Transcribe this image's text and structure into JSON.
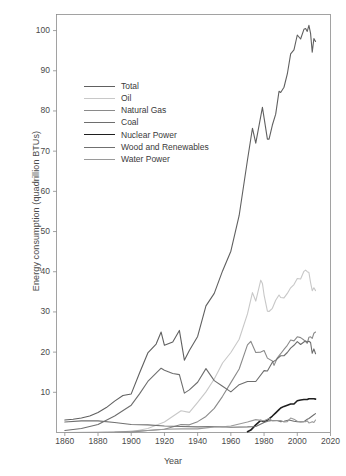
{
  "chart_data": {
    "type": "line",
    "title": "",
    "xlabel": "Year",
    "ylabel": "Energy consumption (quadrillion BTUs)",
    "xlim": [
      1855,
      2020
    ],
    "ylim": [
      0,
      104
    ],
    "xticks": [
      1860,
      1880,
      1900,
      1920,
      1940,
      1960,
      1980,
      2000,
      2020
    ],
    "yticks": [
      10,
      20,
      30,
      40,
      50,
      60,
      70,
      80,
      90,
      100
    ],
    "grid": false,
    "legend_position": "upper left",
    "series": [
      {
        "name": "Total",
        "color": "#606060",
        "width": 1.1,
        "x": [
          1860,
          1865,
          1870,
          1875,
          1880,
          1885,
          1890,
          1895,
          1900,
          1905,
          1910,
          1915,
          1918,
          1920,
          1925,
          1929,
          1932,
          1935,
          1940,
          1945,
          1950,
          1955,
          1960,
          1965,
          1970,
          1973,
          1975,
          1979,
          1980,
          1982,
          1983,
          1985,
          1987,
          1989,
          1990,
          1992,
          1994,
          1996,
          1998,
          2000,
          2002,
          2004,
          2005,
          2006,
          2007,
          2008,
          2009,
          2010,
          2011
        ],
        "values": [
          3.1,
          3.3,
          3.6,
          4.1,
          5.0,
          6.2,
          7.8,
          9.2,
          9.6,
          14.8,
          19.8,
          22.0,
          25.0,
          21.7,
          22.5,
          25.4,
          18.0,
          20.4,
          23.9,
          31.5,
          34.6,
          40.2,
          45.1,
          54.0,
          67.8,
          75.7,
          72.0,
          80.9,
          78.3,
          73.0,
          73.0,
          76.5,
          79.2,
          84.9,
          84.6,
          85.9,
          89.2,
          94.2,
          95.2,
          98.9,
          97.9,
          100.3,
          100.5,
          99.8,
          101.3,
          99.3,
          94.6,
          98.0,
          97.3
        ]
      },
      {
        "name": "Oil",
        "color": "#c8c8c8",
        "width": 1.1,
        "x": [
          1860,
          1880,
          1900,
          1910,
          1920,
          1930,
          1935,
          1940,
          1945,
          1950,
          1955,
          1960,
          1965,
          1970,
          1973,
          1975,
          1978,
          1979,
          1980,
          1982,
          1983,
          1985,
          1987,
          1989,
          1990,
          1992,
          1994,
          1996,
          1998,
          2000,
          2002,
          2004,
          2005,
          2006,
          2007,
          2008,
          2009,
          2010,
          2011
        ],
        "values": [
          0.0,
          0.1,
          0.2,
          1.0,
          2.6,
          5.4,
          5.0,
          7.5,
          10.1,
          13.3,
          17.3,
          19.9,
          23.2,
          29.5,
          34.8,
          32.7,
          37.9,
          37.1,
          34.2,
          30.2,
          30.1,
          30.9,
          32.9,
          34.2,
          33.6,
          33.5,
          34.6,
          36.0,
          36.8,
          38.3,
          38.2,
          40.1,
          40.4,
          40.0,
          39.8,
          37.3,
          35.3,
          36.0,
          35.3
        ]
      },
      {
        "name": "Natural Gas",
        "color": "#8a8a8a",
        "width": 1.1,
        "x": [
          1860,
          1885,
          1900,
          1910,
          1920,
          1930,
          1935,
          1940,
          1945,
          1950,
          1955,
          1960,
          1965,
          1970,
          1972,
          1975,
          1978,
          1980,
          1982,
          1985,
          1986,
          1988,
          1990,
          1992,
          1994,
          1996,
          1998,
          2000,
          2002,
          2004,
          2005,
          2006,
          2007,
          2008,
          2009,
          2010,
          2011
        ],
        "values": [
          0.0,
          0.0,
          0.1,
          0.5,
          0.8,
          2.0,
          1.9,
          2.7,
          4.0,
          6.0,
          9.0,
          12.4,
          15.8,
          21.8,
          22.7,
          19.9,
          20.0,
          20.4,
          18.5,
          17.8,
          16.7,
          18.6,
          19.6,
          20.7,
          21.7,
          23.0,
          22.8,
          23.8,
          23.6,
          23.0,
          22.6,
          22.2,
          23.7,
          23.8,
          23.4,
          24.7,
          25.0
        ]
      },
      {
        "name": "Coal",
        "color": "#6e6e6e",
        "width": 1.1,
        "x": [
          1860,
          1870,
          1880,
          1890,
          1900,
          1905,
          1910,
          1918,
          1920,
          1925,
          1929,
          1932,
          1935,
          1940,
          1945,
          1950,
          1955,
          1960,
          1965,
          1970,
          1975,
          1980,
          1982,
          1985,
          1987,
          1990,
          1992,
          1994,
          1996,
          1998,
          2000,
          2002,
          2004,
          2005,
          2006,
          2007,
          2008,
          2009,
          2010,
          2011
        ],
        "values": [
          0.5,
          1.0,
          2.0,
          4.1,
          6.8,
          9.6,
          12.7,
          16.0,
          15.5,
          14.7,
          14.4,
          9.8,
          10.6,
          12.5,
          15.9,
          12.9,
          11.5,
          10.1,
          11.9,
          12.7,
          12.7,
          15.4,
          15.3,
          17.5,
          18.0,
          19.1,
          19.1,
          19.9,
          21.0,
          21.7,
          22.6,
          21.9,
          22.5,
          22.8,
          22.5,
          22.7,
          22.4,
          19.7,
          20.8,
          19.6
        ]
      },
      {
        "name": "Nuclear Power",
        "color": "#1f1f1f",
        "width": 1.6,
        "x": [
          1970,
          1972,
          1975,
          1978,
          1980,
          1982,
          1985,
          1987,
          1989,
          1990,
          1992,
          1994,
          1996,
          1998,
          2000,
          2002,
          2004,
          2005,
          2006,
          2007,
          2008,
          2009,
          2010,
          2011
        ],
        "values": [
          0.2,
          0.6,
          1.9,
          3.0,
          2.7,
          3.1,
          4.1,
          4.9,
          5.7,
          6.1,
          6.5,
          6.8,
          7.1,
          7.1,
          7.9,
          8.1,
          8.2,
          8.2,
          8.2,
          8.4,
          8.4,
          8.4,
          8.4,
          8.3
        ]
      },
      {
        "name": "Wood and Renewables",
        "color": "#707070",
        "width": 1.1,
        "x": [
          1860,
          1870,
          1880,
          1890,
          1900,
          1910,
          1920,
          1930,
          1940,
          1950,
          1960,
          1970,
          1975,
          1980,
          1983,
          1985,
          1988,
          1990,
          1992,
          1995,
          1998,
          2000,
          2002,
          2004,
          2005,
          2006,
          2007,
          2008,
          2009,
          2010,
          2011
        ],
        "values": [
          2.6,
          2.9,
          2.9,
          2.5,
          2.0,
          1.9,
          1.6,
          1.5,
          1.4,
          1.5,
          1.3,
          1.4,
          1.5,
          2.5,
          2.9,
          3.0,
          3.0,
          2.7,
          2.8,
          3.1,
          2.8,
          2.7,
          2.6,
          2.7,
          3.0,
          3.3,
          3.5,
          3.8,
          4.1,
          4.4,
          4.7
        ]
      },
      {
        "name": "Water Power",
        "color": "#9a9a9a",
        "width": 1.1,
        "x": [
          1860,
          1880,
          1890,
          1900,
          1910,
          1920,
          1930,
          1940,
          1950,
          1955,
          1960,
          1965,
          1970,
          1975,
          1980,
          1983,
          1985,
          1990,
          1992,
          1994,
          1996,
          1998,
          2000,
          2002,
          2004,
          2005,
          2006,
          2007,
          2008,
          2009,
          2010,
          2011
        ],
        "values": [
          0.0,
          0.0,
          0.1,
          0.3,
          0.5,
          0.8,
          0.9,
          0.9,
          1.4,
          1.4,
          1.6,
          2.1,
          2.6,
          3.2,
          2.9,
          3.5,
          2.9,
          3.0,
          2.6,
          2.7,
          3.6,
          3.3,
          2.8,
          2.7,
          2.7,
          2.7,
          2.9,
          2.4,
          2.5,
          2.7,
          2.5,
          3.1
        ]
      }
    ]
  },
  "axes": {
    "xlabel": "Year",
    "ylabel": "Energy consumption (quadrillion BTUs)",
    "xticklabels": [
      "1860",
      "1880",
      "1900",
      "1920",
      "1940",
      "1960",
      "1980",
      "2000",
      "2020"
    ],
    "yticklabels": [
      "10",
      "20",
      "30",
      "40",
      "50",
      "60",
      "70",
      "80",
      "90",
      "100"
    ]
  },
  "legend": {
    "entries": [
      {
        "label": "Total"
      },
      {
        "label": "Oil"
      },
      {
        "label": "Natural Gas"
      },
      {
        "label": "Coal"
      },
      {
        "label": "Nuclear Power"
      },
      {
        "label": "Wood and Renewables"
      },
      {
        "label": "Water Power"
      }
    ]
  },
  "style": {
    "background": "#ffffff",
    "axis_color": "#8c8c8c",
    "text_color": "#4a4a4a"
  }
}
